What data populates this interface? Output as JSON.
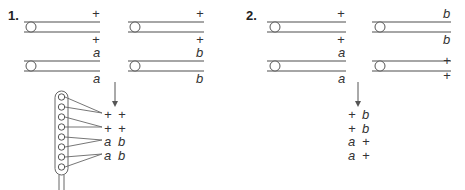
{
  "panels": [
    {
      "number": "1.",
      "pairs": [
        {
          "top": "+",
          "bottom": "+"
        },
        {
          "top": "+",
          "bottom": "+"
        },
        {
          "top": "a",
          "bottom": "a"
        },
        {
          "top": "b",
          "bottom": "b"
        }
      ],
      "result_rows": [
        [
          "+",
          "+"
        ],
        [
          "+",
          "+"
        ],
        [
          "a",
          "b"
        ],
        [
          "a",
          "b"
        ]
      ],
      "has_comb": true
    },
    {
      "number": "2.",
      "pairs": [
        {
          "top": "+",
          "bottom": "+"
        },
        {
          "top": "b",
          "bottom": "b"
        },
        {
          "top": "a",
          "bottom": "a"
        },
        {
          "top": "+",
          "bottom": "+"
        }
      ],
      "result_rows": [
        [
          "+",
          "b"
        ],
        [
          "+",
          "b"
        ],
        [
          "a",
          "+"
        ],
        [
          "a",
          "+"
        ]
      ],
      "has_comb": false
    }
  ],
  "colors": {
    "line": "#888888",
    "text": "#333333"
  }
}
